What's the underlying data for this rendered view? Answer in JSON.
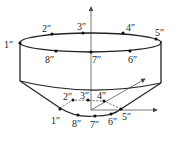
{
  "diagram": {
    "stroke_color": "#222222",
    "top_rim_labels": [
      {
        "id": "1",
        "text": "1″"
      },
      {
        "id": "2",
        "text": "2″"
      },
      {
        "id": "3",
        "text": "3″"
      },
      {
        "id": "4",
        "text": "4″"
      },
      {
        "id": "5",
        "text": "5″"
      },
      {
        "id": "6",
        "text": "6″"
      },
      {
        "id": "7",
        "text": "7″"
      },
      {
        "id": "8",
        "text": "8″"
      }
    ],
    "bottom_rim_labels": [
      {
        "id": "1",
        "text": "1″"
      },
      {
        "id": "2",
        "text": "2″"
      },
      {
        "id": "3",
        "text": "3″"
      },
      {
        "id": "4",
        "text": "4″"
      },
      {
        "id": "5",
        "text": "5″"
      },
      {
        "id": "6",
        "text": "6″"
      },
      {
        "id": "7",
        "text": "7″"
      },
      {
        "id": "8",
        "text": "8″"
      }
    ]
  }
}
